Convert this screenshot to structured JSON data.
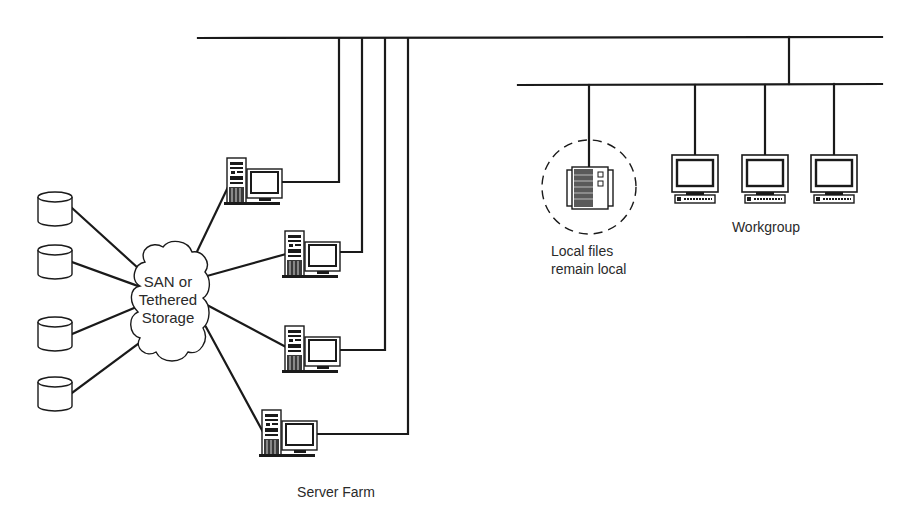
{
  "diagram": {
    "title": "",
    "labels": {
      "cloud_line1": "SAN or",
      "cloud_line2": "Tethered",
      "cloud_line3": "Storage",
      "server_farm": "Server Farm",
      "local_line1": "Local files",
      "local_line2": "remain local",
      "workgroup": "Workgroup"
    },
    "nodes": [
      {
        "id": "disk-1",
        "type": "storage-disk"
      },
      {
        "id": "disk-2",
        "type": "storage-disk"
      },
      {
        "id": "disk-3",
        "type": "storage-disk"
      },
      {
        "id": "disk-4",
        "type": "storage-disk"
      },
      {
        "id": "san-cloud",
        "type": "cloud",
        "label": "SAN or Tethered Storage"
      },
      {
        "id": "server-1",
        "type": "server-workstation",
        "group": "Server Farm"
      },
      {
        "id": "server-2",
        "type": "server-workstation",
        "group": "Server Farm"
      },
      {
        "id": "server-3",
        "type": "server-workstation",
        "group": "Server Farm"
      },
      {
        "id": "server-4",
        "type": "server-workstation",
        "group": "Server Farm"
      },
      {
        "id": "local-storage",
        "type": "local-storage-device",
        "label": "Local files remain local"
      },
      {
        "id": "workstation-1",
        "type": "workstation",
        "group": "Workgroup"
      },
      {
        "id": "workstation-2",
        "type": "workstation",
        "group": "Workgroup"
      },
      {
        "id": "workstation-3",
        "type": "workstation",
        "group": "Workgroup"
      },
      {
        "id": "backbone-lan",
        "type": "network-bus"
      },
      {
        "id": "workgroup-lan",
        "type": "network-bus"
      }
    ],
    "edges": [
      {
        "from": "disk-1",
        "to": "san-cloud"
      },
      {
        "from": "disk-2",
        "to": "san-cloud"
      },
      {
        "from": "disk-3",
        "to": "san-cloud"
      },
      {
        "from": "disk-4",
        "to": "san-cloud"
      },
      {
        "from": "san-cloud",
        "to": "server-1"
      },
      {
        "from": "san-cloud",
        "to": "server-2"
      },
      {
        "from": "san-cloud",
        "to": "server-3"
      },
      {
        "from": "san-cloud",
        "to": "server-4"
      },
      {
        "from": "server-1",
        "to": "backbone-lan"
      },
      {
        "from": "server-2",
        "to": "backbone-lan"
      },
      {
        "from": "server-3",
        "to": "backbone-lan"
      },
      {
        "from": "server-4",
        "to": "backbone-lan"
      },
      {
        "from": "backbone-lan",
        "to": "workgroup-lan"
      },
      {
        "from": "workgroup-lan",
        "to": "local-storage"
      },
      {
        "from": "workgroup-lan",
        "to": "workstation-1"
      },
      {
        "from": "workgroup-lan",
        "to": "workstation-2"
      },
      {
        "from": "workgroup-lan",
        "to": "workstation-3"
      }
    ],
    "colors": {
      "line": "#1a1a1a",
      "background": "#ffffff",
      "text": "#2a2a2a"
    }
  }
}
